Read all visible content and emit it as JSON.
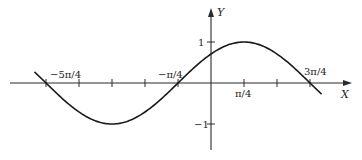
{
  "chart_data": {
    "type": "line",
    "title": "",
    "xlabel": "X",
    "ylabel": "Y",
    "function": "y = sin(x + π/4)",
    "x_unit": "π/4",
    "x_tick_positions_in_units": [
      -5,
      -4,
      -3,
      -2,
      -1,
      0,
      1,
      2,
      3
    ],
    "x_tick_labels": [
      {
        "at": -5,
        "text": "−5π/4"
      },
      {
        "at": -1,
        "text": "−π/4"
      },
      {
        "at": 1,
        "text": "π/4"
      },
      {
        "at": 3,
        "text": "3π/4"
      }
    ],
    "y_tick_labels": [
      {
        "at": 1,
        "text": "1"
      },
      {
        "at": -1,
        "text": "−1"
      }
    ],
    "xlim_units": [
      -6.1,
      4.1
    ],
    "ylim": [
      -1.6,
      1.8
    ],
    "curve_range_units": [
      -5.35,
      3.35
    ],
    "key_points": [
      {
        "x": "-5π/4",
        "y": 0
      },
      {
        "x": "-3π/4",
        "y": -1
      },
      {
        "x": "-π/4",
        "y": 0
      },
      {
        "x": "π/4",
        "y": 1
      },
      {
        "x": "3π/4",
        "y": 0
      }
    ],
    "grid": false,
    "legend": null
  },
  "axes": {
    "x_label": "X",
    "y_label": "Y",
    "tick_1": "1",
    "tick_neg1": "−1",
    "label_neg5pi4": "−5π/4",
    "label_negpi4": "−π/4",
    "label_pi4": "π/4",
    "label_3pi4": "3π/4"
  }
}
